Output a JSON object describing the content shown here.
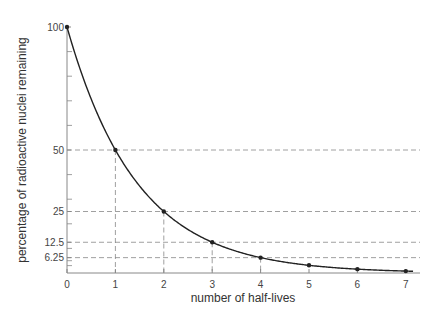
{
  "chart_data": {
    "type": "line",
    "title": "",
    "xlabel": "number of half-lives",
    "ylabel": "percentage of radioactive nuclei remaining",
    "x": [
      0,
      1,
      2,
      3,
      4,
      5,
      6,
      7
    ],
    "series": [
      {
        "name": "radioactive decay",
        "values": [
          100,
          50,
          25,
          12.5,
          6.25,
          3.125,
          1.5625,
          0.78125
        ]
      }
    ],
    "x_ticks": [
      "0",
      "1",
      "2",
      "3",
      "4",
      "5",
      "6",
      "7"
    ],
    "y_tick_labels": [
      {
        "value": 100,
        "label": "100"
      },
      {
        "value": 50,
        "label": "50"
      },
      {
        "value": 25,
        "label": "25"
      },
      {
        "value": 12.5,
        "label": "12.5"
      },
      {
        "value": 6.25,
        "label": "6.25"
      }
    ],
    "y_minor_ticks": [
      90,
      80,
      70,
      60,
      40,
      30,
      20,
      10,
      5,
      3
    ],
    "guide_lines": [
      {
        "x": 1,
        "y": 50
      },
      {
        "x": 2,
        "y": 25
      },
      {
        "x": 3,
        "y": 12.5
      },
      {
        "x": 4,
        "y": 6.25
      }
    ],
    "xlim": [
      0,
      7.3
    ],
    "ylim": [
      0,
      100
    ],
    "grid": false,
    "legend": "none",
    "colors": {
      "curve": "#222222",
      "axis": "#888888",
      "guide": "#888888",
      "text": "#444444"
    }
  }
}
